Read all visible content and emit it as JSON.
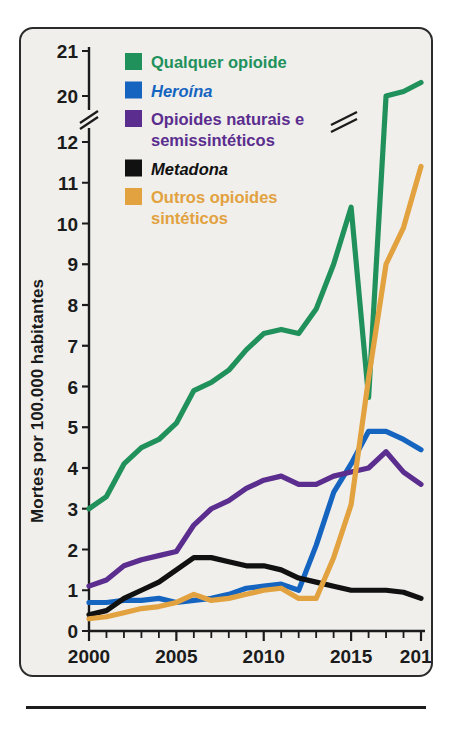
{
  "figure": {
    "panel_background": "#f0efec",
    "panel_border_color": "#2b2b2b",
    "y_axis_title": "Mortes por 100.000 habitantes"
  },
  "legend": {
    "position": "top-left-inside",
    "entries": [
      {
        "label": "Qualquer opioide",
        "color": "#21915c",
        "swatch": "legend-swatch-green",
        "italic": false
      },
      {
        "label": "Heroína",
        "color": "#1565c0",
        "swatch": "legend-swatch-blue",
        "italic": true
      },
      {
        "label": "Opioides naturais e",
        "label2": "semissintéticos",
        "color": "#5b2d8e",
        "swatch": "legend-swatch-purple",
        "italic": false
      },
      {
        "label": "Metadona",
        "color": "#111111",
        "swatch": "legend-swatch-black",
        "italic": true
      },
      {
        "label": "Outros opioides",
        "label2": "sintéticos",
        "color": "#e2a23f",
        "swatch": "legend-swatch-orange",
        "italic": false
      }
    ]
  },
  "axes": {
    "x_tick_labels": [
      "2000",
      "2005",
      "2010",
      "2015",
      "2019"
    ],
    "x_tick_values": [
      2000,
      2005,
      2010,
      2015,
      2019
    ],
    "x_min": 2000,
    "x_max": 2019,
    "y_tick_labels": [
      "0",
      "1",
      "2",
      "3",
      "4",
      "5",
      "6",
      "7",
      "8",
      "9",
      "10",
      "11",
      "12",
      "20",
      "21"
    ],
    "y_tick_values": [
      0,
      1,
      2,
      3,
      4,
      5,
      6,
      7,
      8,
      9,
      10,
      11,
      12,
      20,
      21
    ],
    "y_axis_break_between": [
      12,
      20
    ],
    "y_axis_break_marker": "double-slash"
  },
  "chart_data": {
    "type": "line",
    "title": "",
    "subtitle": "",
    "xlabel": "",
    "ylabel": "Mortes por 100.000 habitantes",
    "xlim": [
      2000,
      2019
    ],
    "ylim": [
      0,
      21
    ],
    "grid": false,
    "legend_position": "top-left",
    "axis_break": {
      "axis": "y",
      "from": 12,
      "to": 20
    },
    "x": [
      2000,
      2001,
      2002,
      2003,
      2004,
      2005,
      2006,
      2007,
      2008,
      2009,
      2010,
      2011,
      2012,
      2013,
      2014,
      2015,
      2016,
      2017,
      2018,
      2019
    ],
    "series": [
      {
        "name": "Qualquer opioide",
        "color": "#21915c",
        "values": [
          3.0,
          3.3,
          4.1,
          4.5,
          4.7,
          5.1,
          5.9,
          6.1,
          6.4,
          6.9,
          7.3,
          7.4,
          7.3,
          7.9,
          9.0,
          10.4,
          13.3,
          14.9,
          14.6,
          15.5
        ],
        "display_values_note": "curve continues through axis break to 20.0 (2017), 20.0 (2018), 20.3 (2019)",
        "values_upper_segment": {
          "2017": 20.0,
          "2018": 20.1,
          "2019": 20.3
        }
      },
      {
        "name": "Heroína",
        "color": "#1565c0",
        "values": [
          0.7,
          0.7,
          0.75,
          0.75,
          0.8,
          0.7,
          0.75,
          0.8,
          0.9,
          1.05,
          1.1,
          1.15,
          1.0,
          2.1,
          3.4,
          4.1,
          4.9,
          4.9,
          4.7,
          4.45
        ]
      },
      {
        "name": "Opioides naturais e semissintéticos",
        "color": "#5b2d8e",
        "values": [
          1.1,
          1.25,
          1.6,
          1.75,
          1.85,
          1.95,
          2.6,
          3.0,
          3.2,
          3.5,
          3.7,
          3.8,
          3.6,
          3.6,
          3.8,
          3.9,
          4.0,
          4.4,
          3.9,
          3.6
        ]
      },
      {
        "name": "Metadona",
        "color": "#111111",
        "values": [
          0.4,
          0.5,
          0.8,
          1.0,
          1.2,
          1.5,
          1.8,
          1.8,
          1.7,
          1.6,
          1.6,
          1.5,
          1.3,
          1.2,
          1.1,
          1.0,
          1.0,
          1.0,
          0.95,
          0.8
        ]
      },
      {
        "name": "Outros opioides sintéticos",
        "color": "#e2a23f",
        "values": [
          0.3,
          0.35,
          0.45,
          0.55,
          0.6,
          0.7,
          0.9,
          0.75,
          0.8,
          0.9,
          1.0,
          1.05,
          0.8,
          0.8,
          1.8,
          3.1,
          6.2,
          9.0,
          9.9,
          11.4
        ]
      }
    ]
  }
}
